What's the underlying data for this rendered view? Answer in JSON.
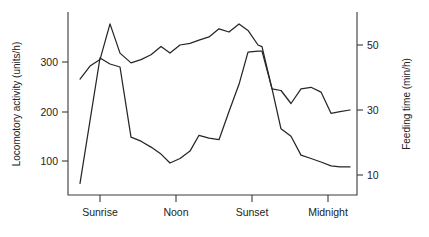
{
  "figure": {
    "background": "#ffffff",
    "line_color": "#262626",
    "axis_color": "#3a3a3a",
    "text_color": "#222222"
  },
  "chart_data": {
    "type": "line",
    "title": "",
    "subtitle": "",
    "xlabel": "",
    "ylabel": "Locomotory activity (units/h)",
    "y2label": "Feeding time (min/h)",
    "grid": false,
    "legend": "none",
    "annotations": [],
    "categories": [
      "Sunrise",
      "Noon",
      "Sunset",
      "Midnight"
    ],
    "category_x": [
      100,
      176,
      252,
      328
    ],
    "xlim": [
      68,
      357
    ],
    "xticks": [
      "Sunrise",
      "Noon",
      "Sunset",
      "Midnight"
    ],
    "ylim": [
      0,
      370
    ],
    "yticks": [
      100,
      200,
      300
    ],
    "ytick_labels": [
      "100",
      "200",
      "300"
    ],
    "y2lim": [
      2,
      58
    ],
    "y2ticks": [
      10,
      30,
      50
    ],
    "y2tick_labels": [
      "10",
      "30",
      "50"
    ],
    "series": [
      {
        "name": "Locomotory activity",
        "axis": "left",
        "units": "units/h",
        "x": [
          80,
          100,
          110,
          120,
          131,
          141,
          151,
          161,
          170,
          180,
          190,
          199,
          209,
          219,
          229,
          239,
          248,
          258,
          262,
          272,
          281,
          291,
          301,
          311,
          321,
          331,
          340,
          350
        ],
        "values": [
          55,
          308,
          296,
          290,
          148,
          140,
          128,
          114,
          96,
          105,
          120,
          152,
          146,
          143,
          200,
          255,
          320,
          322,
          322,
          246,
          165,
          150,
          112,
          105,
          98,
          90,
          88,
          88
        ]
      },
      {
        "name": "Feeding time",
        "axis": "right",
        "units": "min/h",
        "x": [
          80,
          90,
          100,
          110,
          120,
          131,
          141,
          151,
          161,
          170,
          180,
          190,
          199,
          209,
          219,
          229,
          239,
          248,
          258,
          262,
          272,
          281,
          291,
          301,
          311,
          321,
          331,
          340,
          350
        ],
        "values": [
          39.5,
          43.5,
          45.5,
          56.5,
          47.5,
          44.5,
          45.5,
          47.0,
          49.5,
          47.5,
          50.0,
          50.5,
          51.5,
          52.5,
          55.0,
          54.0,
          56.5,
          54.5,
          50.0,
          49.5,
          36.5,
          36.0,
          32.0,
          36.5,
          37.0,
          35.5,
          29.0,
          29.5,
          30.0
        ]
      }
    ]
  }
}
